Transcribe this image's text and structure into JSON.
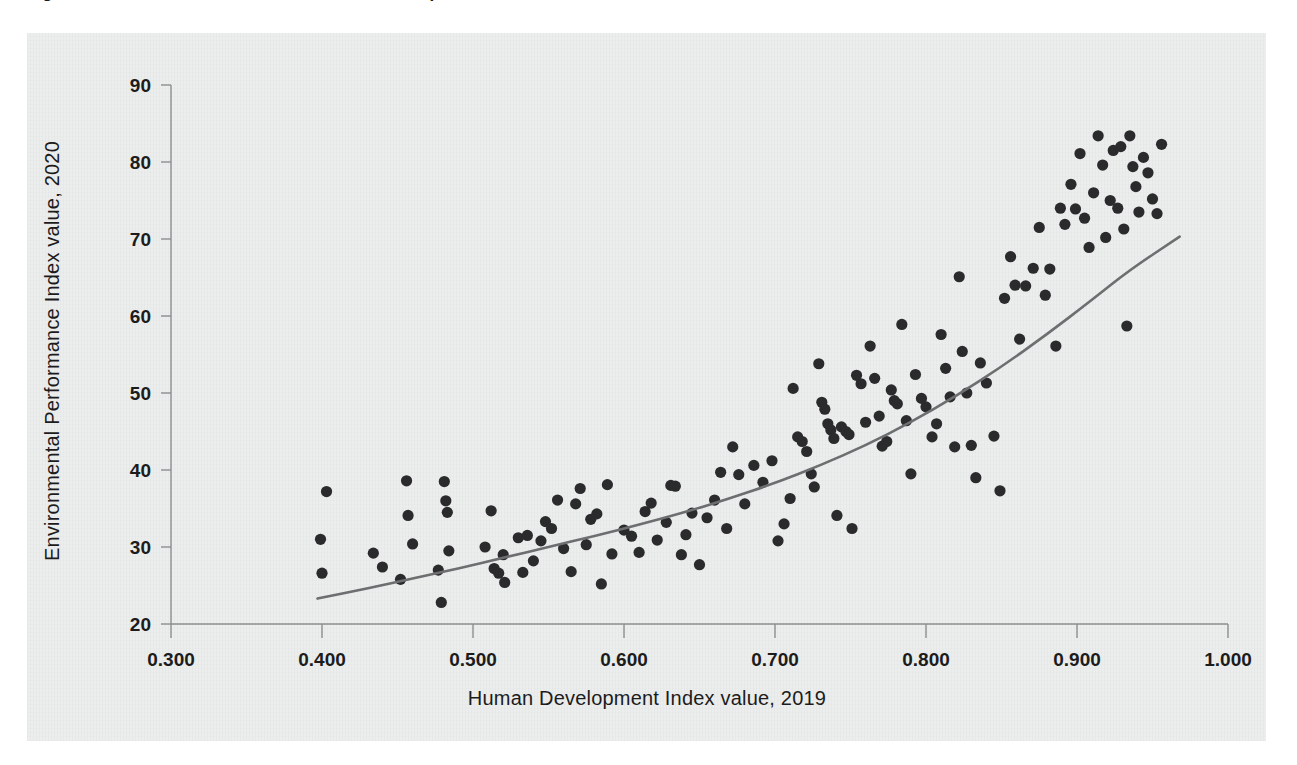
{
  "figure": {
    "title_clipped": "Figure 1. EPI score increases with Human Development Index value",
    "panel_color": "#eceded",
    "dot_color": "#2b2b2d",
    "trend_color": "#6d6f71",
    "axis_color": "#8d8f90"
  },
  "chart_data": {
    "type": "scatter",
    "title": "",
    "xlabel": "Human Development Index value, 2019",
    "ylabel": "Environmental Performance Index value, 2020",
    "xlim": [
      0.3,
      1.0
    ],
    "ylim": [
      20,
      90
    ],
    "xticks": [
      "0.300",
      "0.400",
      "0.500",
      "0.600",
      "0.700",
      "0.800",
      "0.900",
      "1.000"
    ],
    "xtick_values": [
      0.3,
      0.4,
      0.5,
      0.6,
      0.7,
      0.8,
      0.9,
      1.0
    ],
    "yticks": [
      "20",
      "30",
      "40",
      "50",
      "60",
      "70",
      "80",
      "90"
    ],
    "ytick_values": [
      20,
      30,
      40,
      50,
      60,
      70,
      80,
      90
    ],
    "grid": false,
    "legend": "none",
    "marker": {
      "shape": "circle",
      "radius_px": 5.6,
      "color": "#2b2b2d"
    },
    "trendline": {
      "label": "fitted curve",
      "style": "solid",
      "color": "#6d6f71",
      "points": [
        [
          0.397,
          23.3
        ],
        [
          0.43,
          24.6
        ],
        [
          0.46,
          25.9
        ],
        [
          0.49,
          27.2
        ],
        [
          0.52,
          28.6
        ],
        [
          0.55,
          30.0
        ],
        [
          0.58,
          31.4
        ],
        [
          0.61,
          32.9
        ],
        [
          0.64,
          34.5
        ],
        [
          0.67,
          36.3
        ],
        [
          0.7,
          38.3
        ],
        [
          0.73,
          40.6
        ],
        [
          0.76,
          43.2
        ],
        [
          0.79,
          46.2
        ],
        [
          0.82,
          49.6
        ],
        [
          0.85,
          53.4
        ],
        [
          0.88,
          57.6
        ],
        [
          0.91,
          62.1
        ],
        [
          0.935,
          66.0
        ],
        [
          0.968,
          70.3
        ]
      ]
    },
    "points": [
      [
        0.399,
        31.0
      ],
      [
        0.4,
        26.6
      ],
      [
        0.403,
        37.2
      ],
      [
        0.434,
        29.2
      ],
      [
        0.44,
        27.4
      ],
      [
        0.452,
        25.8
      ],
      [
        0.456,
        38.6
      ],
      [
        0.457,
        34.1
      ],
      [
        0.46,
        30.4
      ],
      [
        0.477,
        27.0
      ],
      [
        0.479,
        22.8
      ],
      [
        0.481,
        38.5
      ],
      [
        0.482,
        36.0
      ],
      [
        0.483,
        34.5
      ],
      [
        0.484,
        29.5
      ],
      [
        0.508,
        30.0
      ],
      [
        0.512,
        34.7
      ],
      [
        0.514,
        27.2
      ],
      [
        0.517,
        26.6
      ],
      [
        0.52,
        29.0
      ],
      [
        0.521,
        25.4
      ],
      [
        0.53,
        31.2
      ],
      [
        0.533,
        26.7
      ],
      [
        0.536,
        31.5
      ],
      [
        0.54,
        28.2
      ],
      [
        0.545,
        30.8
      ],
      [
        0.548,
        33.3
      ],
      [
        0.552,
        32.4
      ],
      [
        0.556,
        36.1
      ],
      [
        0.56,
        29.8
      ],
      [
        0.565,
        26.8
      ],
      [
        0.568,
        35.6
      ],
      [
        0.571,
        37.6
      ],
      [
        0.575,
        30.3
      ],
      [
        0.578,
        33.6
      ],
      [
        0.582,
        34.3
      ],
      [
        0.585,
        25.2
      ],
      [
        0.589,
        38.1
      ],
      [
        0.592,
        29.1
      ],
      [
        0.6,
        32.2
      ],
      [
        0.605,
        31.4
      ],
      [
        0.61,
        29.3
      ],
      [
        0.614,
        34.6
      ],
      [
        0.618,
        35.7
      ],
      [
        0.622,
        30.9
      ],
      [
        0.628,
        33.2
      ],
      [
        0.631,
        38.0
      ],
      [
        0.634,
        37.9
      ],
      [
        0.638,
        29.0
      ],
      [
        0.641,
        31.6
      ],
      [
        0.645,
        34.4
      ],
      [
        0.65,
        27.7
      ],
      [
        0.655,
        33.8
      ],
      [
        0.66,
        36.1
      ],
      [
        0.664,
        39.7
      ],
      [
        0.668,
        32.4
      ],
      [
        0.672,
        43.0
      ],
      [
        0.676,
        39.4
      ],
      [
        0.68,
        35.6
      ],
      [
        0.686,
        40.6
      ],
      [
        0.692,
        38.4
      ],
      [
        0.698,
        41.2
      ],
      [
        0.702,
        30.8
      ],
      [
        0.706,
        33.0
      ],
      [
        0.71,
        36.3
      ],
      [
        0.712,
        50.6
      ],
      [
        0.715,
        44.3
      ],
      [
        0.718,
        43.7
      ],
      [
        0.721,
        42.4
      ],
      [
        0.724,
        39.5
      ],
      [
        0.726,
        37.8
      ],
      [
        0.729,
        53.8
      ],
      [
        0.731,
        48.8
      ],
      [
        0.733,
        47.9
      ],
      [
        0.735,
        46.0
      ],
      [
        0.737,
        45.2
      ],
      [
        0.739,
        44.1
      ],
      [
        0.741,
        34.1
      ],
      [
        0.744,
        45.6
      ],
      [
        0.747,
        45.0
      ],
      [
        0.749,
        44.6
      ],
      [
        0.751,
        32.4
      ],
      [
        0.754,
        52.3
      ],
      [
        0.757,
        51.2
      ],
      [
        0.76,
        46.2
      ],
      [
        0.763,
        56.1
      ],
      [
        0.766,
        51.9
      ],
      [
        0.769,
        47.0
      ],
      [
        0.771,
        43.1
      ],
      [
        0.774,
        43.7
      ],
      [
        0.777,
        50.4
      ],
      [
        0.779,
        49.0
      ],
      [
        0.781,
        48.6
      ],
      [
        0.784,
        58.9
      ],
      [
        0.787,
        46.4
      ],
      [
        0.79,
        39.5
      ],
      [
        0.793,
        52.4
      ],
      [
        0.797,
        49.3
      ],
      [
        0.8,
        48.2
      ],
      [
        0.804,
        44.3
      ],
      [
        0.807,
        46.0
      ],
      [
        0.81,
        57.6
      ],
      [
        0.813,
        53.2
      ],
      [
        0.816,
        49.5
      ],
      [
        0.819,
        43.0
      ],
      [
        0.822,
        65.1
      ],
      [
        0.824,
        55.4
      ],
      [
        0.827,
        50.0
      ],
      [
        0.83,
        43.2
      ],
      [
        0.833,
        39.0
      ],
      [
        0.836,
        53.9
      ],
      [
        0.84,
        51.3
      ],
      [
        0.845,
        44.4
      ],
      [
        0.849,
        37.3
      ],
      [
        0.852,
        62.3
      ],
      [
        0.856,
        67.7
      ],
      [
        0.859,
        64.0
      ],
      [
        0.862,
        57.0
      ],
      [
        0.866,
        63.9
      ],
      [
        0.871,
        66.2
      ],
      [
        0.875,
        71.5
      ],
      [
        0.879,
        62.7
      ],
      [
        0.882,
        66.1
      ],
      [
        0.886,
        56.1
      ],
      [
        0.889,
        74.0
      ],
      [
        0.892,
        71.9
      ],
      [
        0.896,
        77.1
      ],
      [
        0.899,
        73.9
      ],
      [
        0.902,
        81.1
      ],
      [
        0.905,
        72.7
      ],
      [
        0.908,
        68.9
      ],
      [
        0.911,
        76.0
      ],
      [
        0.914,
        83.4
      ],
      [
        0.917,
        79.6
      ],
      [
        0.919,
        70.2
      ],
      [
        0.922,
        75.0
      ],
      [
        0.924,
        81.5
      ],
      [
        0.927,
        74.0
      ],
      [
        0.929,
        82.0
      ],
      [
        0.931,
        71.3
      ],
      [
        0.933,
        58.7
      ],
      [
        0.935,
        83.4
      ],
      [
        0.937,
        79.4
      ],
      [
        0.939,
        76.8
      ],
      [
        0.941,
        73.5
      ],
      [
        0.944,
        80.6
      ],
      [
        0.947,
        78.6
      ],
      [
        0.95,
        75.2
      ],
      [
        0.953,
        73.3
      ],
      [
        0.956,
        82.3
      ]
    ]
  }
}
